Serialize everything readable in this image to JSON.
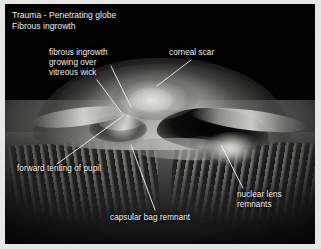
{
  "figure": {
    "title_line_1": "Trauma - Penetrating globe",
    "title_line_2": "Fibrous ingrowth",
    "title_block": "Trauma - Penetrating globe\nFibrous ingrowth",
    "background_color": "#000000",
    "frame_color": "#e6e6e4",
    "text_color": "#f2f2f0",
    "modality": "gross pathology photograph",
    "specimen": "sectioned eye globe, anterior segment"
  },
  "annotations": [
    {
      "id": "fibrous-ingrowth",
      "text": "fibrous ingrowth\ngrowing over\nvitreous wick",
      "label_x": 44,
      "label_y": 44,
      "leaders": [
        {
          "x1": 106,
          "y1": 62,
          "x2": 126,
          "y2": 103
        },
        {
          "x1": 92,
          "y1": 76,
          "x2": 116,
          "y2": 108
        }
      ]
    },
    {
      "id": "corneal-scar",
      "text": "corneal scar",
      "label_x": 164,
      "label_y": 44,
      "leaders": [
        {
          "x1": 186,
          "y1": 56,
          "x2": 152,
          "y2": 82
        }
      ]
    },
    {
      "id": "forward-tenting-of-pupil",
      "text": "forward tenting of pupil",
      "label_x": 12,
      "label_y": 160,
      "leaders": [
        {
          "x1": 52,
          "y1": 160,
          "x2": 118,
          "y2": 112
        }
      ]
    },
    {
      "id": "capsular-bag-remnant",
      "text": "capsular bag remnant",
      "label_x": 105,
      "label_y": 209,
      "leaders": [
        {
          "x1": 150,
          "y1": 206,
          "x2": 126,
          "y2": 141
        }
      ]
    },
    {
      "id": "nuclear-lens-remnants",
      "text": "nuclear lens\nremnants",
      "label_x": 232,
      "label_y": 186,
      "leaders": [
        {
          "x1": 238,
          "y1": 184,
          "x2": 216,
          "y2": 141
        }
      ]
    }
  ]
}
